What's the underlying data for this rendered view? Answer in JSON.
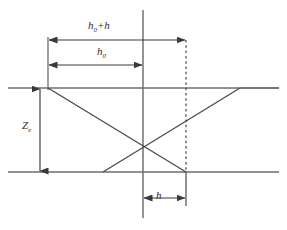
{
  "figure": {
    "type": "geometry-ray-diagram",
    "colors": {
      "solid_line": "#6e6e6e",
      "diagonal_line": "#4a4a4a",
      "axis_line": "#7a7a7a",
      "dashed_line": "#555555",
      "dimension_line": "#3a3a3a",
      "label_text": "#2b2b2b",
      "background": "#ffffff"
    },
    "labels": {
      "top_dimension": "h₀+h",
      "top_dimension_base": "h",
      "top_dimension_sub": "0",
      "top_dimension_suffix": "+h",
      "second_dimension_base": "h",
      "second_dimension_sub": "0",
      "vertical_dimension_base": "Z",
      "vertical_dimension_sub": "e",
      "bottom_dimension": "h"
    },
    "geometry": {
      "vertical_axis_x": 143,
      "upper_horizontal_y": 88,
      "lower_horizontal_y": 172,
      "dashed_vertical_x": 186,
      "left_extension_x": 48,
      "crossing_point_x": 143,
      "crossing_point_y": 148,
      "rising_diagonal_end_x": 240,
      "lower_diagonal_start_x": 103,
      "dim_arrow_top_y": 40,
      "dim_arrow_second_y": 65,
      "dim_arrow_vertical_x": 40,
      "dim_arrow_bottom_y": 198
    }
  }
}
